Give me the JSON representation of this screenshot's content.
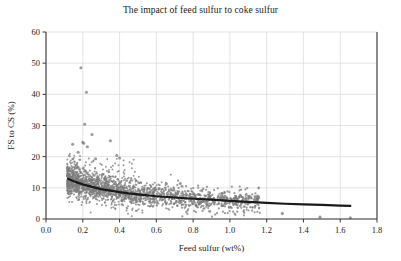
{
  "chart_data": {
    "type": "scatter",
    "title": "The impact of feed sulfur to coke sulfur",
    "xlabel": "Feed sulfur (wt%)",
    "ylabel": "FS to CS (%)",
    "xlim": [
      0.0,
      1.8
    ],
    "ylim": [
      0,
      60
    ],
    "xticks": [
      "0.0",
      "0.2",
      "0.4",
      "0.6",
      "0.8",
      "1.0",
      "1.2",
      "1.4",
      "1.6",
      "1.8"
    ],
    "xtick_values": [
      0.0,
      0.2,
      0.4,
      0.6,
      0.8,
      1.0,
      1.2,
      1.4,
      1.6,
      1.8
    ],
    "yticks": [
      "0",
      "10",
      "20",
      "30",
      "40",
      "50",
      "60"
    ],
    "ytick_values": [
      0,
      10,
      20,
      30,
      40,
      50,
      60
    ],
    "grid": true,
    "legend": null,
    "marker_color": "#7d7d7d",
    "marker_size": 1.6,
    "trend_color": "#1a1a1a",
    "series": [
      {
        "name": "FS to CS observations",
        "description": "Dense gray scatter cloud concentrated between x=0.12 and x=0.70, decaying with feed sulfur",
        "n_points": 1400,
        "x_range": [
          0.11,
          1.66
        ],
        "y_range": [
          0.3,
          48.5
        ],
        "density_core_x": [
          0.13,
          0.6
        ],
        "density_core_y": [
          5,
          16
        ],
        "outliers": [
          {
            "x": 0.19,
            "y": 48.5
          },
          {
            "x": 0.22,
            "y": 40.7
          },
          {
            "x": 0.21,
            "y": 30.4
          },
          {
            "x": 0.25,
            "y": 27.1
          },
          {
            "x": 0.2,
            "y": 24.6
          },
          {
            "x": 0.205,
            "y": 24.3
          },
          {
            "x": 0.145,
            "y": 24.0
          },
          {
            "x": 0.225,
            "y": 23.2
          },
          {
            "x": 0.35,
            "y": 25.1
          },
          {
            "x": 0.175,
            "y": 21.4
          },
          {
            "x": 0.385,
            "y": 20.4
          },
          {
            "x": 0.4,
            "y": 19.6
          },
          {
            "x": 0.27,
            "y": 19.3
          },
          {
            "x": 0.655,
            "y": 11.3
          },
          {
            "x": 0.73,
            "y": 11.4
          },
          {
            "x": 0.89,
            "y": 2.5
          },
          {
            "x": 1.285,
            "y": 1.8
          },
          {
            "x": 1.49,
            "y": 0.6
          },
          {
            "x": 1.655,
            "y": 0.4
          }
        ]
      }
    ],
    "trend_line": {
      "name": "fitted decay curve",
      "color": "#1a1a1a",
      "width": 2.2,
      "x_start": 0.12,
      "x_end": 1.655,
      "points": [
        {
          "x": 0.12,
          "y": 12.9
        },
        {
          "x": 0.16,
          "y": 11.9
        },
        {
          "x": 0.2,
          "y": 11.1
        },
        {
          "x": 0.25,
          "y": 10.3
        },
        {
          "x": 0.3,
          "y": 9.6
        },
        {
          "x": 0.35,
          "y": 9.1
        },
        {
          "x": 0.4,
          "y": 8.6
        },
        {
          "x": 0.45,
          "y": 8.2
        },
        {
          "x": 0.5,
          "y": 7.9
        },
        {
          "x": 0.6,
          "y": 7.3
        },
        {
          "x": 0.7,
          "y": 6.9
        },
        {
          "x": 0.8,
          "y": 6.5
        },
        {
          "x": 0.9,
          "y": 6.2
        },
        {
          "x": 1.0,
          "y": 5.8
        },
        {
          "x": 1.1,
          "y": 5.5
        },
        {
          "x": 1.2,
          "y": 5.2
        },
        {
          "x": 1.3,
          "y": 4.9
        },
        {
          "x": 1.4,
          "y": 4.7
        },
        {
          "x": 1.5,
          "y": 4.5
        },
        {
          "x": 1.6,
          "y": 4.3
        },
        {
          "x": 1.655,
          "y": 4.2
        }
      ]
    }
  }
}
